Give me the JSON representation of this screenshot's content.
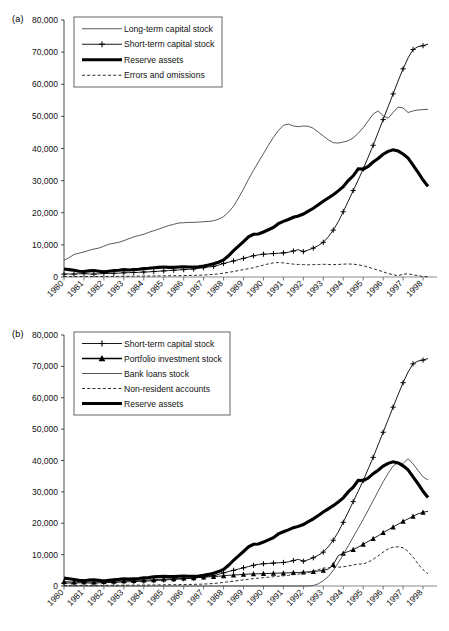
{
  "panels": [
    {
      "id": "a",
      "label": "(a)",
      "legend": [
        {
          "label": "Long-term capital stock",
          "style": "thin"
        },
        {
          "label": "Short-term capital stock",
          "style": "plus"
        },
        {
          "label": "Reserve assets",
          "style": "thick"
        },
        {
          "label": "Errors and omissions",
          "style": "dashed"
        }
      ]
    },
    {
      "id": "b",
      "label": "(b)",
      "legend": [
        {
          "label": "Short-term capital stock",
          "style": "plus"
        },
        {
          "label": "Portfolio investment stock",
          "style": "triangle"
        },
        {
          "label": "Bank loans stock",
          "style": "thin"
        },
        {
          "label": "Non-resident accounts",
          "style": "dashed"
        },
        {
          "label": "Reserve assets",
          "style": "thick"
        }
      ]
    }
  ],
  "axis": {
    "yticks": [
      0,
      10000,
      20000,
      30000,
      40000,
      50000,
      60000,
      70000,
      80000
    ],
    "yticklabels": [
      "0",
      "10,000",
      "20,000",
      "30,000",
      "40,000",
      "50,000",
      "60,000",
      "70,000",
      "80,000"
    ],
    "xticklabels": [
      "1980",
      "1981",
      "1982",
      "1983",
      "1984",
      "1985",
      "1986",
      "1987",
      "1988",
      "1989",
      "1990",
      "1991",
      "1992",
      "1993",
      "1994",
      "1995",
      "1996",
      "1997",
      "1998"
    ],
    "ylim": [
      0,
      80000
    ],
    "xlim": [
      1980,
      1998.5
    ]
  },
  "chart_data": [
    {
      "type": "line",
      "id": "a",
      "title": "(a)",
      "xlabel": "",
      "ylabel": "",
      "ylim": [
        0,
        80000
      ],
      "grid": false,
      "legend_position": "top-left",
      "x": [
        1980,
        1980.25,
        1980.5,
        1980.75,
        1981,
        1981.25,
        1981.5,
        1981.75,
        1982,
        1982.25,
        1982.5,
        1982.75,
        1983,
        1983.25,
        1983.5,
        1983.75,
        1984,
        1984.25,
        1984.5,
        1984.75,
        1985,
        1985.25,
        1985.5,
        1985.75,
        1986,
        1986.25,
        1986.5,
        1986.75,
        1987,
        1987.25,
        1987.5,
        1987.75,
        1988,
        1988.25,
        1988.5,
        1988.75,
        1989,
        1989.25,
        1989.5,
        1989.75,
        1990,
        1990.25,
        1990.5,
        1990.75,
        1991,
        1991.25,
        1991.5,
        1991.75,
        1992,
        1992.25,
        1992.5,
        1992.75,
        1993,
        1993.25,
        1993.5,
        1993.75,
        1994,
        1994.25,
        1994.5,
        1994.75,
        1995,
        1995.25,
        1995.5,
        1995.75,
        1996,
        1996.25,
        1996.5,
        1996.75,
        1997,
        1997.25,
        1997.5,
        1997.75,
        1998,
        1998.25
      ],
      "series": [
        {
          "name": "Long-term capital stock",
          "style": "thin",
          "values": [
            5200,
            6000,
            7000,
            7400,
            7800,
            8300,
            8700,
            9000,
            9600,
            10200,
            10500,
            10800,
            11300,
            11900,
            12500,
            12900,
            13300,
            13900,
            14400,
            14900,
            15500,
            16000,
            16400,
            16800,
            16900,
            17000,
            17000,
            17100,
            17200,
            17300,
            17500,
            18000,
            18800,
            20200,
            22000,
            24600,
            27400,
            30400,
            33200,
            35800,
            38400,
            41000,
            43500,
            45600,
            47200,
            47600,
            47000,
            46800,
            47000,
            46900,
            46300,
            45100,
            43900,
            42700,
            41800,
            41700,
            42000,
            42400,
            43300,
            44700,
            46500,
            48600,
            50700,
            51700,
            50200,
            49400,
            51200,
            52900,
            52600,
            51200,
            51700,
            52000,
            52100,
            52200
          ]
        },
        {
          "name": "Short-term capital stock",
          "style": "plus",
          "values": [
            900,
            950,
            900,
            1000,
            1050,
            950,
            900,
            1000,
            1100,
            1100,
            1150,
            1200,
            1300,
            1350,
            1400,
            1450,
            1550,
            1600,
            1700,
            1800,
            1900,
            2000,
            2100,
            2200,
            2300,
            2400,
            2500,
            2700,
            2900,
            3100,
            3300,
            3700,
            4200,
            4600,
            5000,
            5400,
            5800,
            6200,
            6600,
            6900,
            7100,
            7200,
            7300,
            7400,
            7500,
            7700,
            8100,
            8500,
            7900,
            8400,
            9000,
            9800,
            10800,
            12500,
            14600,
            17200,
            20300,
            23600,
            26900,
            30200,
            33600,
            37300,
            41000,
            45000,
            49000,
            53000,
            57000,
            61000,
            64800,
            68200,
            70800,
            71700,
            72000,
            72500
          ]
        },
        {
          "name": "Reserve assets",
          "style": "thick",
          "values": [
            2500,
            2300,
            2100,
            1800,
            1700,
            1900,
            2000,
            1800,
            1600,
            1800,
            2000,
            2100,
            2300,
            2200,
            2300,
            2400,
            2600,
            2700,
            2900,
            3000,
            3100,
            3000,
            3000,
            3100,
            3200,
            3100,
            3100,
            3200,
            3400,
            3700,
            4100,
            4600,
            5300,
            6600,
            8200,
            9600,
            11000,
            12500,
            13300,
            13400,
            14000,
            14700,
            15400,
            16600,
            17300,
            17900,
            18600,
            19000,
            19600,
            20500,
            21400,
            22500,
            23600,
            24600,
            25600,
            26800,
            28100,
            30000,
            31500,
            33700,
            33600,
            34400,
            35800,
            36900,
            38200,
            39100,
            39600,
            39200,
            38300,
            37000,
            34800,
            32600,
            30200,
            28200
          ]
        },
        {
          "name": "Errors and omissions",
          "style": "dashed",
          "values": [
            200,
            180,
            150,
            160,
            170,
            150,
            140,
            150,
            170,
            180,
            190,
            200,
            220,
            230,
            250,
            260,
            280,
            300,
            320,
            340,
            360,
            380,
            400,
            420,
            450,
            480,
            520,
            560,
            620,
            700,
            820,
            980,
            1200,
            1450,
            1700,
            2000,
            2300,
            2600,
            2900,
            3300,
            3700,
            4100,
            4400,
            4500,
            4400,
            4200,
            4000,
            3900,
            3850,
            3800,
            3850,
            3900,
            3950,
            3900,
            3850,
            3900,
            4000,
            4050,
            4000,
            3800,
            3500,
            3100,
            2600,
            2100,
            1600,
            1100,
            700,
            400,
            900,
            1000,
            700,
            400,
            150,
            100
          ]
        }
      ]
    },
    {
      "type": "line",
      "id": "b",
      "title": "(b)",
      "xlabel": "",
      "ylabel": "",
      "ylim": [
        0,
        80000
      ],
      "grid": false,
      "legend_position": "top-left",
      "x": [
        1980,
        1980.25,
        1980.5,
        1980.75,
        1981,
        1981.25,
        1981.5,
        1981.75,
        1982,
        1982.25,
        1982.5,
        1982.75,
        1983,
        1983.25,
        1983.5,
        1983.75,
        1984,
        1984.25,
        1984.5,
        1984.75,
        1985,
        1985.25,
        1985.5,
        1985.75,
        1986,
        1986.25,
        1986.5,
        1986.75,
        1987,
        1987.25,
        1987.5,
        1987.75,
        1988,
        1988.25,
        1988.5,
        1988.75,
        1989,
        1989.25,
        1989.5,
        1989.75,
        1990,
        1990.25,
        1990.5,
        1990.75,
        1991,
        1991.25,
        1991.5,
        1991.75,
        1992,
        1992.25,
        1992.5,
        1992.75,
        1993,
        1993.25,
        1993.5,
        1993.75,
        1994,
        1994.25,
        1994.5,
        1994.75,
        1995,
        1995.25,
        1995.5,
        1995.75,
        1996,
        1996.25,
        1996.5,
        1996.75,
        1997,
        1997.25,
        1997.5,
        1997.75,
        1998,
        1998.25
      ],
      "series": [
        {
          "name": "Short-term capital stock",
          "style": "plus",
          "values": [
            900,
            950,
            900,
            1000,
            1050,
            950,
            900,
            1000,
            1100,
            1100,
            1150,
            1200,
            1300,
            1350,
            1400,
            1450,
            1550,
            1600,
            1700,
            1800,
            1900,
            2000,
            2100,
            2200,
            2300,
            2400,
            2500,
            2700,
            2900,
            3100,
            3300,
            3700,
            4200,
            4600,
            5000,
            5400,
            5800,
            6200,
            6600,
            6900,
            7100,
            7200,
            7300,
            7400,
            7500,
            7700,
            8100,
            8500,
            7900,
            8400,
            9000,
            9800,
            10800,
            12500,
            14600,
            17200,
            20300,
            23600,
            26900,
            30200,
            33600,
            37300,
            41000,
            45000,
            49000,
            53000,
            57000,
            61000,
            64800,
            68200,
            70800,
            71700,
            72000,
            72500
          ]
        },
        {
          "name": "Portfolio investment stock",
          "style": "triangle",
          "values": [
            1400,
            1300,
            1250,
            1300,
            1350,
            1300,
            1280,
            1320,
            1400,
            1450,
            1500,
            1550,
            1650,
            1700,
            1750,
            1800,
            1900,
            1950,
            2000,
            2100,
            2200,
            2250,
            2300,
            2400,
            2500,
            2550,
            2600,
            2700,
            2800,
            2900,
            3000,
            3100,
            3250,
            3400,
            3500,
            3600,
            3700,
            3800,
            3850,
            3900,
            3950,
            4000,
            4050,
            4100,
            4150,
            4200,
            4250,
            4300,
            4400,
            4500,
            4600,
            4800,
            5000,
            5400,
            6800,
            9700,
            10400,
            11000,
            11600,
            12400,
            13300,
            14200,
            15100,
            16000,
            17000,
            17900,
            18800,
            19700,
            20600,
            21400,
            22200,
            23000,
            23500,
            23800
          ]
        },
        {
          "name": "Bank loans stock",
          "style": "thin",
          "values": [
            0,
            0,
            0,
            0,
            0,
            0,
            0,
            0,
            0,
            0,
            0,
            0,
            0,
            0,
            0,
            0,
            0,
            0,
            0,
            0,
            0,
            0,
            0,
            0,
            0,
            0,
            0,
            0,
            0,
            0,
            0,
            0,
            0,
            0,
            0,
            0,
            0,
            0,
            0,
            0,
            0,
            0,
            0,
            0,
            0,
            0,
            0,
            0,
            0,
            0,
            150,
            700,
            1700,
            3000,
            5000,
            7400,
            10000,
            12800,
            15600,
            18400,
            21200,
            24200,
            27200,
            30200,
            33200,
            35900,
            38200,
            39400,
            39000,
            40600,
            38900,
            36800,
            34800,
            33800
          ]
        },
        {
          "name": "Non-resident accounts",
          "style": "dashed",
          "values": [
            200,
            200,
            180,
            180,
            200,
            190,
            180,
            190,
            200,
            210,
            220,
            230,
            250,
            260,
            270,
            280,
            300,
            320,
            340,
            360,
            380,
            400,
            420,
            450,
            480,
            500,
            520,
            560,
            620,
            700,
            800,
            950,
            1150,
            1350,
            1550,
            1750,
            1950,
            2150,
            2350,
            2500,
            2650,
            2800,
            2950,
            3100,
            3250,
            3400,
            3600,
            3800,
            4000,
            4300,
            4700,
            5200,
            5700,
            5800,
            5900,
            6000,
            6100,
            6400,
            6700,
            7000,
            7000,
            7600,
            8500,
            9600,
            10800,
            11800,
            12400,
            12500,
            12200,
            11000,
            9200,
            7000,
            5200,
            3900
          ]
        },
        {
          "name": "Reserve assets",
          "style": "thick",
          "values": [
            2500,
            2300,
            2100,
            1800,
            1700,
            1900,
            2000,
            1800,
            1600,
            1800,
            2000,
            2100,
            2300,
            2200,
            2300,
            2400,
            2600,
            2700,
            2900,
            3000,
            3100,
            3000,
            3000,
            3100,
            3200,
            3100,
            3100,
            3200,
            3400,
            3700,
            4100,
            4600,
            5300,
            6600,
            8200,
            9600,
            11000,
            12500,
            13300,
            13400,
            14000,
            14700,
            15400,
            16600,
            17300,
            17900,
            18600,
            19000,
            19600,
            20500,
            21400,
            22500,
            23600,
            24600,
            25600,
            26800,
            28100,
            30000,
            31500,
            33700,
            33600,
            34400,
            35800,
            36900,
            38200,
            39100,
            39600,
            39200,
            38300,
            37000,
            34800,
            32600,
            30200,
            28200
          ]
        }
      ]
    }
  ]
}
